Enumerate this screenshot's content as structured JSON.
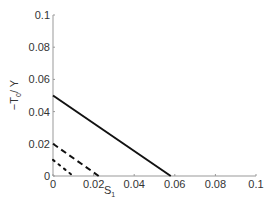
{
  "chart_data": {
    "type": "line",
    "title": "",
    "xlabel": "S1",
    "ylabel": "-T0/Y",
    "xlim": [
      0,
      0.1
    ],
    "ylim": [
      0,
      0.1
    ],
    "xticks": [
      "0",
      "0.02",
      "0.04",
      "0.06",
      "0.08",
      "0.1"
    ],
    "yticks": [
      "0",
      "0.02",
      "0.04",
      "0.06",
      "0.08",
      "0.1"
    ],
    "grid": false,
    "series": [
      {
        "name": "solid",
        "style": "solid",
        "x": [
          0,
          0.058
        ],
        "y": [
          0.05,
          0
        ]
      },
      {
        "name": "dashed",
        "style": "dashed",
        "x": [
          0,
          0.0225
        ],
        "y": [
          0.02,
          0
        ]
      },
      {
        "name": "dotted",
        "style": "dotted",
        "x": [
          0,
          0.01
        ],
        "y": [
          0.01,
          0
        ]
      }
    ]
  }
}
